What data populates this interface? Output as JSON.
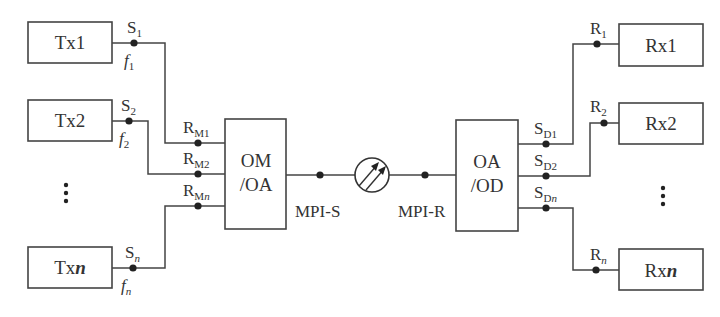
{
  "diagram": {
    "type": "WDM optical transmission system block diagram",
    "transmitters": [
      {
        "id": "tx1",
        "label": "Tx1",
        "point": "S",
        "point_sub": "1",
        "freq": "f",
        "freq_sub": "1"
      },
      {
        "id": "tx2",
        "label": "Tx2",
        "point": "S",
        "point_sub": "2",
        "freq": "f",
        "freq_sub": "2"
      },
      {
        "id": "txn",
        "label": "Tx",
        "label_ital": "n",
        "point": "S",
        "point_sub": "n",
        "freq": "f",
        "freq_sub": "n"
      }
    ],
    "mux_inputs": [
      {
        "label": "R",
        "sub": "M1"
      },
      {
        "label": "R",
        "sub": "M2"
      },
      {
        "label": "R",
        "sub": "M",
        "sub_ital": "n"
      }
    ],
    "mux": {
      "line1": "OM",
      "line2": "/OA"
    },
    "mpi_s": "MPI-S",
    "amplifier_icon": "optical-amplifier-circle",
    "mpi_r": "MPI-R",
    "demux": {
      "line1": "OA",
      "line2": "/OD"
    },
    "demux_outputs": [
      {
        "label": "S",
        "sub": "D1"
      },
      {
        "label": "S",
        "sub": "D2"
      },
      {
        "label": "S",
        "sub": "D",
        "sub_ital": "n"
      }
    ],
    "receivers": [
      {
        "id": "rx1",
        "label": "Rx1",
        "point": "R",
        "point_sub": "1"
      },
      {
        "id": "rx2",
        "label": "Rx2",
        "point": "R",
        "point_sub": "2"
      },
      {
        "id": "rxn",
        "label": "Rx",
        "label_ital": "n",
        "point": "R",
        "point_sub": "n"
      }
    ],
    "ellipsis": "⋮"
  }
}
